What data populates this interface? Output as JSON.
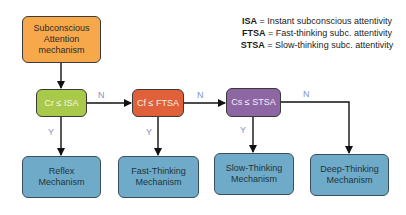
{
  "start": {
    "label_lines": [
      "Subconscious",
      "Attention",
      "mechanism"
    ],
    "color": "#f7a84a"
  },
  "decisions": [
    {
      "label": "Cr ≤ ISA",
      "color": "#a9c94a"
    },
    {
      "label": "Cf ≤ FTSA",
      "color": "#e0603a"
    },
    {
      "label": "Cs ≤ STSA",
      "color": "#8e66a4"
    }
  ],
  "outcomes": [
    {
      "label_lines": [
        "Reflex",
        "Mechanism"
      ]
    },
    {
      "label_lines": [
        "Fast-Thinking",
        "Mechanism"
      ]
    },
    {
      "label_lines": [
        "Slow-Thinking",
        "Mechanism"
      ]
    },
    {
      "label_lines": [
        "Deep-Thinking",
        "Mechanism"
      ]
    }
  ],
  "outcome_color": "#6fabc8",
  "edge_labels": {
    "no": "N",
    "yes": "Y"
  },
  "legend": [
    {
      "abbr": "ISA",
      "sep": " = ",
      "text": "Instant subconscious attentivity"
    },
    {
      "abbr": "FTSA",
      "sep": " = ",
      "text": "Fast-thinking subc. attentivity"
    },
    {
      "abbr": "STSA",
      "sep": " = ",
      "text": "Slow-thinking subc. attentivity"
    }
  ]
}
